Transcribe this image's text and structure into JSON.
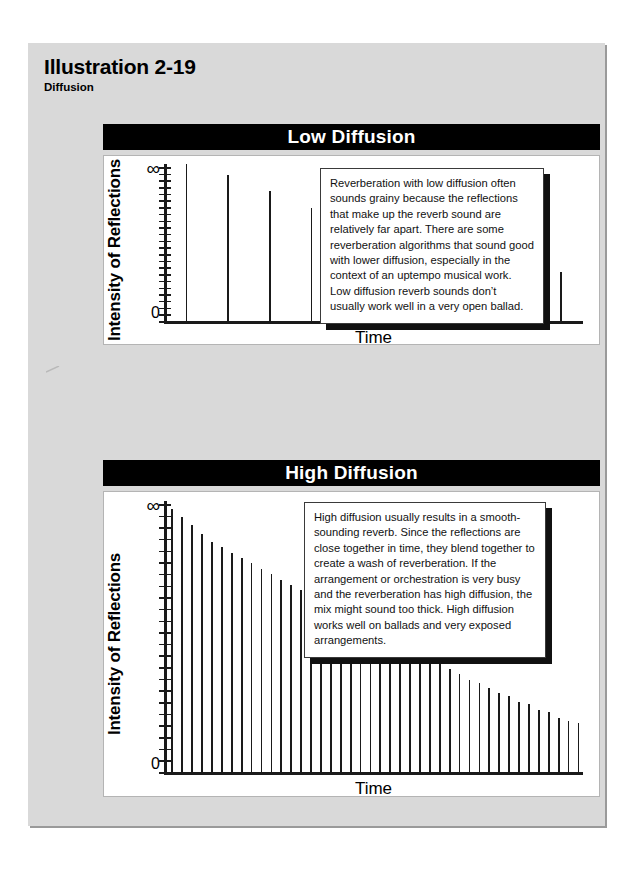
{
  "heading": {
    "title": "Illustration 2-19",
    "subtitle": "Diffusion"
  },
  "colors": {
    "page_background": "#ffffff",
    "card_background": "#d9d9d9",
    "title_bar": "#000000",
    "title_bar_text": "#ffffff",
    "plot_background": "#ffffff",
    "axis": "#1a1a1a",
    "callout_shadow": "#111111"
  },
  "panels": [
    {
      "id": "low-diffusion",
      "title": "Low Diffusion",
      "y_axis": {
        "label": "Intensity of Reflections",
        "top_tick_label": "∞",
        "bottom_tick_label": "0",
        "tick_count": 24
      },
      "x_axis": {
        "label": "Time"
      },
      "callout": "Reverberation with low diffusion often sounds grainy because the reflections that make up the reverb sound are relatively far apart. There are some reverberation algorithms that sound good with lower diffusion, especially in the context of an uptempo musical work. Low diffusion reverb sounds don’t usually work well in a very open ballad."
    },
    {
      "id": "high-diffusion",
      "title": "High Diffusion",
      "y_axis": {
        "label": "Intensity of Reflections",
        "top_tick_label": "∞",
        "bottom_tick_label": "0",
        "tick_count": 24
      },
      "x_axis": {
        "label": "Time"
      },
      "callout": "High diffusion usually results in a smooth-sounding reverb. Since the reflections are close together in time, they blend together to create a wash of reverberation. If the arrangement or orchestration is very busy and the reverberation has high diffusion, the mix might sound too thick. High diffusion works well on ballads and very exposed arrangements."
    }
  ],
  "chart_data": [
    {
      "type": "bar",
      "id": "low-diffusion-chart",
      "title": "Low Diffusion",
      "xlabel": "Time",
      "ylabel": "Intensity of Reflections",
      "ytick_labels": [
        "0",
        "∞"
      ],
      "ylim": [
        0,
        100
      ],
      "grid": false,
      "legend": null,
      "note": "Sparse, widely spaced reflections decaying over time",
      "x": [
        1,
        2,
        3,
        4,
        5,
        6,
        7,
        8,
        9,
        10
      ],
      "values": [
        100,
        93,
        83,
        72,
        62,
        54,
        47,
        41,
        35,
        31
      ]
    },
    {
      "type": "bar",
      "id": "high-diffusion-chart",
      "title": "High Diffusion",
      "xlabel": "Time",
      "ylabel": "Intensity of Reflections",
      "ytick_labels": [
        "0",
        "∞"
      ],
      "ylim": [
        0,
        100
      ],
      "grid": false,
      "legend": null,
      "note": "Dense, closely spaced reflections blending into a smooth decay",
      "x": [
        1,
        2,
        3,
        4,
        5,
        6,
        7,
        8,
        9,
        10,
        11,
        12,
        13,
        14,
        15,
        16,
        17,
        18,
        19,
        20,
        21,
        22,
        23,
        24,
        25,
        26,
        27,
        28,
        29,
        30,
        31,
        32,
        33,
        34,
        35,
        36,
        37,
        38,
        39,
        40,
        41,
        42
      ],
      "values": [
        97,
        94,
        91,
        88,
        85,
        83,
        81,
        79,
        77,
        75,
        73,
        71,
        69,
        67,
        65,
        63,
        61,
        59,
        57,
        55,
        53,
        51,
        49,
        47,
        45,
        43,
        41,
        40,
        38,
        36,
        34,
        33,
        31,
        29,
        28,
        26,
        25,
        23,
        22,
        20,
        19,
        18
      ]
    }
  ]
}
